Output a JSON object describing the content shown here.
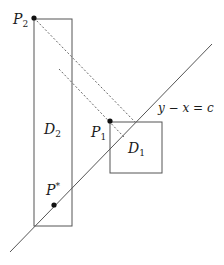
{
  "diagram": {
    "type": "geometric-construction",
    "labels": {
      "p2": "P",
      "p2_sub": "2",
      "p1": "P",
      "p1_sub": "1",
      "pstar": "P",
      "pstar_sup": "*",
      "d1": "D",
      "d1_sub": "1",
      "d2": "D",
      "d2_sub": "2",
      "line_eq": "y − x = c"
    },
    "colors": {
      "stroke": "#555555",
      "dashed": "#666666",
      "point": "#111111"
    },
    "shapes": {
      "D2": {
        "x": 34,
        "y": 19,
        "w": 38,
        "h": 207
      },
      "D1": {
        "x": 110,
        "y": 122,
        "w": 52,
        "h": 51
      },
      "diagonal": {
        "x1": 10,
        "y1": 252,
        "x2": 212,
        "y2": 44
      },
      "points": {
        "P2": {
          "x": 34,
          "y": 18
        },
        "P1": {
          "x": 110,
          "y": 121
        },
        "Pstar": {
          "x": 54,
          "y": 205
        }
      }
    }
  }
}
